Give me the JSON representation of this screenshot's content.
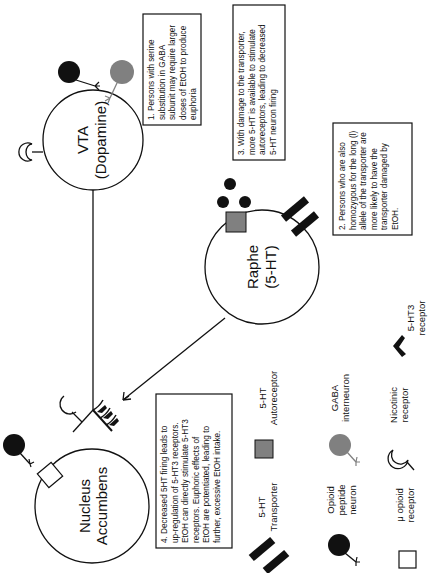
{
  "diagram": {
    "orientation": "rotated-90-ccw",
    "nodes": {
      "vta": {
        "line1": "VTA",
        "line2": "(Dopamine)"
      },
      "raphe": {
        "line1": "Raphe",
        "line2": "(5-HT)"
      },
      "nucleus_accumbens": {
        "line1": "Nucleus",
        "line2": "Accumbens"
      }
    },
    "notes": [
      {
        "id": 1,
        "lines": [
          "1. Persons with serine",
          "substitution in GABA",
          "subunit may require larger",
          "doses of EtOH to produce",
          "euphoria"
        ]
      },
      {
        "id": 2,
        "lines": [
          "2. Persons who are also",
          "homozygous for the long (l)",
          "allele of the transporter are",
          "more likely to have the",
          "transporter damaged by",
          "EtOH."
        ]
      },
      {
        "id": 3,
        "lines": [
          "3. With damage to the transporter,",
          "more 5-HT is available to stimulate",
          "autoreceptors, leading to decreased",
          "5-HT neuron firing"
        ]
      },
      {
        "id": 4,
        "lines": [
          "4. Decreased 5HT firing leads to",
          "up-regulation of 5-HT3 receptors.",
          "EtOH can directly stimulate 5-HT3",
          "receptors. Euphoric effects of",
          "EtOH are potentiated, leading to",
          "further, excessive EtOH intake."
        ]
      }
    ],
    "legend": [
      {
        "icon": "transporter-bars-icon",
        "line1": "5-HT",
        "line2": "Transporter"
      },
      {
        "icon": "autoreceptor-square-icon",
        "line1": "5-HT",
        "line2": "Autoreceptor"
      },
      {
        "icon": "opioid-neuron-icon",
        "line1": "Opioid",
        "line2": "peptide",
        "line3": "neuron"
      },
      {
        "icon": "gaba-neuron-icon",
        "line1": "GABA",
        "line2": "interneuron"
      },
      {
        "icon": "mu-receptor-icon",
        "line1": "μ opioid",
        "line2": "receptor"
      },
      {
        "icon": "nicotinic-receptor-icon",
        "line1": "Nicotinic",
        "line2": "receptor"
      },
      {
        "icon": "5ht3-receptor-icon",
        "line1": "5-HT3",
        "line2": "receptor"
      }
    ],
    "colors": {
      "ink": "#111111",
      "gray_fill": "#808080",
      "background": "#ffffff"
    }
  }
}
